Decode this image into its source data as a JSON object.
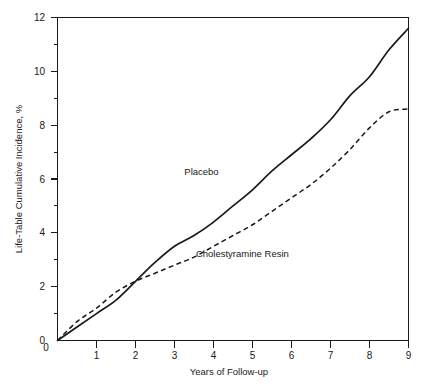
{
  "chart_data": {
    "type": "line",
    "title": "",
    "xlabel": "Years of Follow-up",
    "ylabel": "Life-Table Cumulative Incidence, %",
    "xlim": [
      0,
      9
    ],
    "ylim": [
      0,
      12
    ],
    "grid": false,
    "legend_position": "inline-annotation",
    "x_ticks": [
      "0",
      "1",
      "2",
      "3",
      "4",
      "5",
      "6",
      "7",
      "8",
      "9"
    ],
    "x_tick_values": [
      0,
      1,
      2,
      3,
      4,
      5,
      6,
      7,
      8,
      9
    ],
    "x_minor_tick_values": [],
    "y_ticks": [
      "0",
      "2",
      "4",
      "6",
      "8",
      "10",
      "12"
    ],
    "y_tick_values": [
      0,
      2,
      4,
      6,
      8,
      10,
      12
    ],
    "y_minor_tick_values": [
      1,
      3,
      5,
      7,
      9,
      11
    ],
    "x": [
      0,
      0.5,
      1,
      1.5,
      2,
      2.5,
      3,
      3.5,
      4,
      4.5,
      5,
      5.5,
      6,
      6.5,
      7,
      7.5,
      8,
      8.5,
      9
    ],
    "series": [
      {
        "name": "Placebo",
        "style": "solid",
        "color": "#1a1a1a",
        "values": [
          0,
          0.5,
          1.0,
          1.5,
          2.2,
          2.9,
          3.5,
          3.9,
          4.4,
          5.0,
          5.6,
          6.3,
          6.9,
          7.5,
          8.2,
          9.1,
          9.8,
          10.8,
          11.6
        ],
        "label_position": {
          "x": 3.25,
          "y": 6.15
        }
      },
      {
        "name": "Cholestyramine Resin",
        "style": "dashed",
        "color": "#1a1a1a",
        "values": [
          0,
          0.7,
          1.2,
          1.8,
          2.2,
          2.5,
          2.8,
          3.1,
          3.5,
          3.9,
          4.3,
          4.8,
          5.3,
          5.8,
          6.4,
          7.1,
          7.9,
          8.5,
          8.6
        ],
        "label_position": {
          "x": 3.55,
          "y": 3.1
        }
      }
    ],
    "annotations": [
      {
        "text": "Placebo",
        "x": 3.25,
        "y": 6.15
      },
      {
        "text": "Cholestyramine Resin",
        "x": 3.55,
        "y": 3.1
      }
    ]
  },
  "axes": {
    "y_axis_title": "Life-Table Cumulative Incidence, %",
    "x_axis_title": "Years of Follow-up"
  },
  "labels": {
    "y_0": "0",
    "y_2": "2",
    "y_4": "4",
    "y_6": "6",
    "y_8": "8",
    "y_10": "10",
    "y_12": "12",
    "x_0": "0",
    "x_1": "1",
    "x_2": "2",
    "x_3": "3",
    "x_4": "4",
    "x_5": "5",
    "x_6": "6",
    "x_7": "7",
    "x_8": "8",
    "x_9": "9",
    "series_placebo": "Placebo",
    "series_cholestyramine": "Cholestyramine Resin"
  }
}
